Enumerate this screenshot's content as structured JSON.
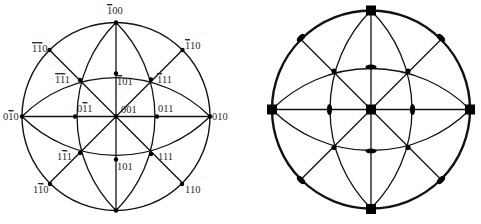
{
  "left_projection": {
    "title": "Stereographic projection with indexed poles",
    "center": [
      116,
      116.5
    ],
    "radius": 94,
    "poles": [
      {
        "id": "m100",
        "label": "100",
        "bar": [
          0
        ],
        "pos": [
          116,
          22.5
        ],
        "label_pos": [
          107,
          14
        ]
      },
      {
        "id": "p100",
        "label": "",
        "bar": [],
        "pos": [
          116,
          210.5
        ],
        "label_pos": [
          0,
          0
        ]
      },
      {
        "id": "m110",
        "label": "110",
        "bar": [
          0,
          1
        ],
        "pos": [
          49.5,
          50
        ],
        "label_pos": [
          32,
          52
        ]
      },
      {
        "id": "m1p10",
        "label": "110",
        "bar": [
          0
        ],
        "pos": [
          182.5,
          50
        ],
        "label_pos": [
          185,
          49
        ]
      },
      {
        "id": "m1m11",
        "label": "111",
        "bar": [
          0,
          1
        ],
        "pos": [
          80,
          80
        ],
        "label_pos": [
          55,
          83
        ]
      },
      {
        "id": "m101",
        "label": "101",
        "bar": [
          0
        ],
        "pos": [
          116,
          73.5
        ],
        "label_pos": [
          117,
          85
        ]
      },
      {
        "id": "m111",
        "label": "111",
        "bar": [
          0
        ],
        "pos": [
          151,
          79.5
        ],
        "label_pos": [
          157,
          83
        ]
      },
      {
        "id": "0m10",
        "label": "010",
        "bar": [
          1
        ],
        "pos": [
          22,
          116.5
        ],
        "label_pos": [
          3,
          120
        ]
      },
      {
        "id": "0m11",
        "label": "011",
        "bar": [
          1
        ],
        "pos": [
          75,
          116.5
        ],
        "label_pos": [
          77,
          112
        ]
      },
      {
        "id": "001",
        "label": "001",
        "bar": [],
        "pos": [
          116,
          116.5
        ],
        "label_pos": [
          121,
          113
        ]
      },
      {
        "id": "011",
        "label": "011",
        "bar": [],
        "pos": [
          157,
          116.5
        ],
        "label_pos": [
          158,
          112
        ]
      },
      {
        "id": "010",
        "label": "010",
        "bar": [],
        "pos": [
          210,
          116.5
        ],
        "label_pos": [
          212,
          120
        ]
      },
      {
        "id": "1m11",
        "label": "111",
        "bar": [
          1
        ],
        "pos": [
          80,
          153
        ],
        "label_pos": [
          57,
          160
        ]
      },
      {
        "id": "101",
        "label": "101",
        "bar": [],
        "pos": [
          116,
          159.5
        ],
        "label_pos": [
          117,
          170
        ]
      },
      {
        "id": "111",
        "label": "111",
        "bar": [],
        "pos": [
          151,
          154
        ],
        "label_pos": [
          158,
          160
        ]
      },
      {
        "id": "1m10",
        "label": "110",
        "bar": [
          1
        ],
        "pos": [
          50,
          184
        ],
        "label_pos": [
          33,
          193
        ]
      },
      {
        "id": "110",
        "label": "110",
        "bar": [],
        "pos": [
          182,
          184
        ],
        "label_pos": [
          185,
          193
        ]
      }
    ]
  },
  "right_projection": {
    "title": "Stereographic projection with symmetry elements",
    "center": [
      371,
      109.5
    ],
    "radius": 99,
    "fourfold": [
      [
        371,
        10.5
      ],
      [
        371,
        209
      ],
      [
        272,
        109.5
      ],
      [
        470,
        109.5
      ],
      [
        371,
        109.5
      ]
    ],
    "twofold_inner": [
      [
        371,
        67
      ],
      [
        371,
        151
      ],
      [
        329.5,
        109.5
      ],
      [
        412.5,
        109.5
      ]
    ],
    "twofold_rim": [
      [
        301,
        38
      ],
      [
        441,
        38
      ],
      [
        301,
        180
      ],
      [
        441,
        180
      ]
    ],
    "threefold": [
      [
        334,
        71
      ],
      [
        408,
        71
      ],
      [
        334,
        147.5
      ],
      [
        408,
        147.5
      ]
    ]
  }
}
